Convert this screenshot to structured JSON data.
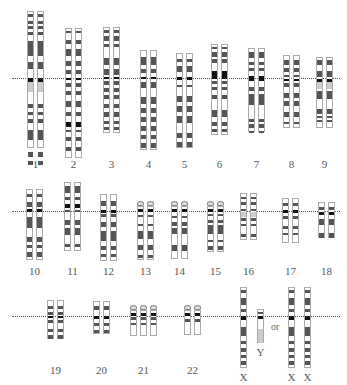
{
  "colors": {
    "dark": "#555555",
    "black": "#111111",
    "pale": "#cccccc",
    "outline": "#aaaaaa",
    "line": "#555555"
  },
  "rows": [
    {
      "line_y": 78,
      "line_x1": 12,
      "line_x2": 340
    },
    {
      "line_y": 211,
      "line_x1": 12,
      "line_x2": 340
    },
    {
      "line_y": 316,
      "line_x1": 12,
      "line_x2": 340
    }
  ],
  "chromosomes": [
    {
      "label": "1",
      "row": 0,
      "x": 27,
      "top": 11,
      "bottom": 148,
      "copies": 2,
      "sat": false,
      "bands": [
        [
          2,
          5,
          "d"
        ],
        [
          9,
          12,
          "d"
        ],
        [
          14,
          17,
          "d"
        ],
        [
          20,
          23,
          "d"
        ],
        [
          29,
          44,
          "d"
        ],
        [
          50,
          57,
          "d"
        ],
        [
          66,
          70,
          "k"
        ],
        [
          70,
          80,
          "p"
        ],
        [
          92,
          96,
          "d"
        ],
        [
          100,
          103,
          "d"
        ],
        [
          107,
          111,
          "d"
        ],
        [
          118,
          128,
          "d"
        ],
        [
          140,
          145,
          "d"
        ],
        [
          149,
          153,
          "d"
        ]
      ]
    },
    {
      "label": "2",
      "row": 0,
      "x": 65,
      "top": 28,
      "bottom": 158,
      "copies": 2,
      "sat": false,
      "bands": [
        [
          2,
          4,
          "d"
        ],
        [
          11,
          15,
          "d"
        ],
        [
          20,
          27,
          "d"
        ],
        [
          32,
          37,
          "d"
        ],
        [
          41,
          45,
          "d"
        ],
        [
          49,
          51,
          "k"
        ],
        [
          54,
          58,
          "d"
        ],
        [
          62,
          66,
          "d"
        ],
        [
          72,
          78,
          "d"
        ],
        [
          83,
          87,
          "d"
        ],
        [
          93,
          98,
          "k"
        ],
        [
          101,
          103,
          "d"
        ],
        [
          108,
          112,
          "d"
        ],
        [
          118,
          122,
          "d"
        ]
      ]
    },
    {
      "label": "3",
      "row": 0,
      "x": 103,
      "top": 27,
      "bottom": 133,
      "copies": 2,
      "sat": false,
      "bands": [
        [
          2,
          5,
          "d"
        ],
        [
          8,
          13,
          "d"
        ],
        [
          16,
          19,
          "d"
        ],
        [
          30,
          37,
          "d"
        ],
        [
          41,
          47,
          "d"
        ],
        [
          49,
          51,
          "k"
        ],
        [
          53,
          57,
          "d"
        ],
        [
          60,
          64,
          "d"
        ],
        [
          67,
          71,
          "d"
        ],
        [
          76,
          80,
          "d"
        ],
        [
          84,
          89,
          "d"
        ],
        [
          93,
          96,
          "d"
        ],
        [
          99,
          102,
          "d"
        ]
      ]
    },
    {
      "label": "4",
      "row": 0,
      "x": 140,
      "top": 50,
      "bottom": 150,
      "copies": 2,
      "sat": false,
      "bands": [
        [
          6,
          14,
          "d"
        ],
        [
          18,
          22,
          "d"
        ],
        [
          26,
          28,
          "k"
        ],
        [
          31,
          37,
          "d"
        ],
        [
          46,
          53,
          "d"
        ],
        [
          57,
          62,
          "d"
        ],
        [
          66,
          71,
          "d"
        ],
        [
          75,
          80,
          "d"
        ],
        [
          84,
          88,
          "d"
        ],
        [
          92,
          97,
          "d"
        ]
      ]
    },
    {
      "label": "5",
      "row": 0,
      "x": 176,
      "top": 53,
      "bottom": 148,
      "copies": 2,
      "sat": false,
      "bands": [
        [
          5,
          8,
          "d"
        ],
        [
          12,
          18,
          "d"
        ],
        [
          23,
          26,
          "k"
        ],
        [
          31,
          33,
          "d"
        ],
        [
          42,
          48,
          "d"
        ],
        [
          52,
          58,
          "d"
        ],
        [
          62,
          69,
          "d"
        ],
        [
          79,
          84,
          "d"
        ],
        [
          88,
          93,
          "d"
        ]
      ]
    },
    {
      "label": "6",
      "row": 0,
      "x": 211,
      "top": 44,
      "bottom": 135,
      "copies": 2,
      "sat": false,
      "bands": [
        [
          2,
          4,
          "d"
        ],
        [
          7,
          12,
          "d"
        ],
        [
          14,
          18,
          "d"
        ],
        [
          26,
          34,
          "k"
        ],
        [
          36,
          39,
          "d"
        ],
        [
          42,
          45,
          "d"
        ],
        [
          50,
          54,
          "d"
        ],
        [
          65,
          72,
          "d"
        ],
        [
          77,
          81,
          "d"
        ],
        [
          84,
          87,
          "d"
        ]
      ]
    },
    {
      "label": "7",
      "row": 0,
      "x": 248,
      "top": 48,
      "bottom": 132,
      "copies": 2,
      "sat": false,
      "bands": [
        [
          3,
          9,
          "d"
        ],
        [
          13,
          16,
          "d"
        ],
        [
          19,
          22,
          "d"
        ],
        [
          27,
          32,
          "k"
        ],
        [
          38,
          42,
          "d"
        ],
        [
          45,
          56,
          "d"
        ],
        [
          70,
          73,
          "d"
        ],
        [
          75,
          79,
          "d"
        ],
        [
          82,
          84,
          "d"
        ]
      ]
    },
    {
      "label": "8",
      "row": 0,
      "x": 283,
      "top": 55,
      "bottom": 128,
      "copies": 2,
      "sat": false,
      "bands": [
        [
          4,
          9,
          "d"
        ],
        [
          12,
          16,
          "d"
        ],
        [
          19,
          21,
          "d"
        ],
        [
          23,
          25,
          "k"
        ],
        [
          27,
          31,
          "d"
        ],
        [
          37,
          42,
          "d"
        ],
        [
          45,
          50,
          "d"
        ],
        [
          56,
          61,
          "d"
        ],
        [
          66,
          68,
          "d"
        ]
      ]
    },
    {
      "label": "9",
      "row": 0,
      "x": 316,
      "top": 57,
      "bottom": 128,
      "copies": 2,
      "sat": false,
      "bands": [
        [
          2,
          7,
          "d"
        ],
        [
          13,
          19,
          "d"
        ],
        [
          21,
          24,
          "k"
        ],
        [
          24,
          31,
          "p"
        ],
        [
          33,
          41,
          "d"
        ],
        [
          51,
          56,
          "d"
        ],
        [
          58,
          60,
          "d"
        ],
        [
          62,
          64,
          "d"
        ]
      ]
    },
    {
      "label": "10",
      "row": 1,
      "x": 26,
      "top": 189,
      "bottom": 260,
      "copies": 2,
      "sat": false,
      "bands": [
        [
          4,
          7,
          "d"
        ],
        [
          12,
          17,
          "d"
        ],
        [
          19,
          22,
          "k"
        ],
        [
          27,
          38,
          "d"
        ],
        [
          47,
          52,
          "d"
        ],
        [
          55,
          58,
          "d"
        ],
        [
          62,
          67,
          "d"
        ]
      ]
    },
    {
      "label": "11",
      "row": 1,
      "x": 64,
      "top": 182,
      "bottom": 251,
      "copies": 2,
      "sat": false,
      "bands": [
        [
          3,
          10,
          "d"
        ],
        [
          14,
          17,
          "d"
        ],
        [
          21,
          25,
          "k"
        ],
        [
          27,
          29,
          "d"
        ],
        [
          37,
          42,
          "d"
        ],
        [
          45,
          52,
          "d"
        ],
        [
          61,
          64,
          "d"
        ]
      ]
    },
    {
      "label": "12",
      "row": 1,
      "x": 100,
      "top": 194,
      "bottom": 261,
      "copies": 2,
      "sat": false,
      "bands": [
        [
          6,
          11,
          "d"
        ],
        [
          15,
          18,
          "k"
        ],
        [
          19,
          22,
          "d"
        ],
        [
          27,
          32,
          "d"
        ],
        [
          36,
          46,
          "d"
        ],
        [
          51,
          55,
          "d"
        ],
        [
          59,
          62,
          "d"
        ]
      ]
    },
    {
      "label": "13",
      "row": 1,
      "x": 137,
      "top": 206,
      "bottom": 260,
      "copies": 2,
      "sat": true,
      "bands": [
        [
          2,
          5,
          "k"
        ],
        [
          8,
          10,
          "d"
        ],
        [
          17,
          19,
          "d"
        ],
        [
          24,
          32,
          "d"
        ],
        [
          38,
          43,
          "d"
        ],
        [
          48,
          51,
          "d"
        ]
      ]
    },
    {
      "label": "14",
      "row": 1,
      "x": 171,
      "top": 206,
      "bottom": 259,
      "copies": 2,
      "sat": true,
      "bands": [
        [
          2,
          5,
          "k"
        ],
        [
          9,
          11,
          "d"
        ],
        [
          15,
          19,
          "d"
        ],
        [
          21,
          27,
          "d"
        ],
        [
          38,
          44,
          "d"
        ]
      ]
    },
    {
      "label": "15",
      "row": 1,
      "x": 207,
      "top": 206,
      "bottom": 252,
      "copies": 2,
      "sat": true,
      "bands": [
        [
          2,
          5,
          "k"
        ],
        [
          7,
          9,
          "d"
        ],
        [
          13,
          16,
          "d"
        ],
        [
          18,
          27,
          "d"
        ],
        [
          33,
          35,
          "d"
        ],
        [
          39,
          43,
          "d"
        ]
      ]
    },
    {
      "label": "16",
      "row": 1,
      "x": 240,
      "top": 193,
      "bottom": 240,
      "copies": 2,
      "sat": false,
      "bands": [
        [
          3,
          5,
          "d"
        ],
        [
          8,
          11,
          "d"
        ],
        [
          15,
          17,
          "d"
        ],
        [
          18,
          23,
          "p"
        ],
        [
          24,
          27,
          "d"
        ],
        [
          30,
          32,
          "d"
        ],
        [
          40,
          43,
          "d"
        ]
      ]
    },
    {
      "label": "17",
      "row": 1,
      "x": 282,
      "top": 198,
      "bottom": 243,
      "copies": 2,
      "sat": false,
      "bands": [
        [
          4,
          7,
          "d"
        ],
        [
          11,
          14,
          "k"
        ],
        [
          17,
          20,
          "d"
        ],
        [
          27,
          30,
          "d"
        ],
        [
          34,
          36,
          "d"
        ]
      ]
    },
    {
      "label": "18",
      "row": 1,
      "x": 318,
      "top": 202,
      "bottom": 238,
      "copies": 2,
      "sat": false,
      "bands": [
        [
          4,
          7,
          "d"
        ],
        [
          9,
          12,
          "k"
        ],
        [
          16,
          22,
          "d"
        ],
        [
          30,
          35,
          "d"
        ]
      ]
    },
    {
      "label": "19",
      "row": 2,
      "x": 47,
      "top": 300,
      "bottom": 339,
      "copies": 2,
      "sat": false,
      "bands": [
        [
          5,
          8,
          "d"
        ],
        [
          11,
          14,
          "d"
        ],
        [
          15,
          17,
          "k"
        ],
        [
          19,
          22,
          "d"
        ],
        [
          28,
          31,
          "d"
        ],
        [
          34,
          38,
          "d"
        ]
      ]
    },
    {
      "label": "20",
      "row": 2,
      "x": 93,
      "top": 301,
      "bottom": 334,
      "copies": 2,
      "sat": false,
      "bands": [
        [
          4,
          8,
          "d"
        ],
        [
          14,
          17,
          "k"
        ],
        [
          21,
          24,
          "d"
        ],
        [
          28,
          31,
          "d"
        ]
      ]
    },
    {
      "label": "21",
      "row": 2,
      "x": 130,
      "top": 310,
      "bottom": 336,
      "copies": 3,
      "sat": true,
      "bands": [
        [
          2,
          5,
          "k"
        ],
        [
          6,
          9,
          "d"
        ],
        [
          12,
          14,
          "d"
        ]
      ]
    },
    {
      "label": "22",
      "row": 2,
      "x": 184,
      "top": 310,
      "bottom": 335,
      "copies": 2,
      "sat": true,
      "bands": [
        [
          2,
          5,
          "k"
        ],
        [
          8,
          11,
          "d"
        ]
      ]
    }
  ],
  "sex_chromosomes": {
    "xy": [
      {
        "label": "X",
        "x": 240,
        "top": 287,
        "bottom": 368,
        "bands": [
          [
            2,
            5,
            "d"
          ],
          [
            10,
            17,
            "d"
          ],
          [
            21,
            24,
            "d"
          ],
          [
            28,
            32,
            "k"
          ],
          [
            39,
            48,
            "d"
          ],
          [
            53,
            56,
            "d"
          ],
          [
            60,
            64,
            "d"
          ],
          [
            67,
            70,
            "d"
          ],
          [
            73,
            77,
            "d"
          ]
        ],
        "label_y": 371
      },
      {
        "label": "Y",
        "x": 257,
        "top": 309,
        "bottom": 343,
        "bands": [
          [
            2,
            4,
            "d"
          ],
          [
            6,
            9,
            "k"
          ],
          [
            19,
            33,
            "p"
          ]
        ],
        "label_y": 346
      }
    ],
    "or_label": "or",
    "or_x": 271,
    "or_y": 321,
    "xx": [
      {
        "label": "X",
        "x": 288,
        "top": 287,
        "bottom": 368,
        "bands": [
          [
            2,
            5,
            "d"
          ],
          [
            10,
            17,
            "d"
          ],
          [
            21,
            24,
            "d"
          ],
          [
            28,
            32,
            "k"
          ],
          [
            39,
            48,
            "d"
          ],
          [
            53,
            56,
            "d"
          ],
          [
            60,
            64,
            "d"
          ],
          [
            67,
            70,
            "d"
          ],
          [
            73,
            77,
            "d"
          ]
        ],
        "label_y": 371
      },
      {
        "label": "X",
        "x": 304,
        "top": 287,
        "bottom": 368,
        "bands": [
          [
            2,
            5,
            "d"
          ],
          [
            10,
            17,
            "d"
          ],
          [
            21,
            24,
            "d"
          ],
          [
            28,
            32,
            "k"
          ],
          [
            39,
            48,
            "d"
          ],
          [
            53,
            56,
            "d"
          ],
          [
            60,
            64,
            "d"
          ],
          [
            67,
            70,
            "d"
          ],
          [
            73,
            77,
            "d"
          ]
        ],
        "label_y": 371
      }
    ]
  },
  "label_y_by_row": [
    158,
    265,
    364
  ]
}
